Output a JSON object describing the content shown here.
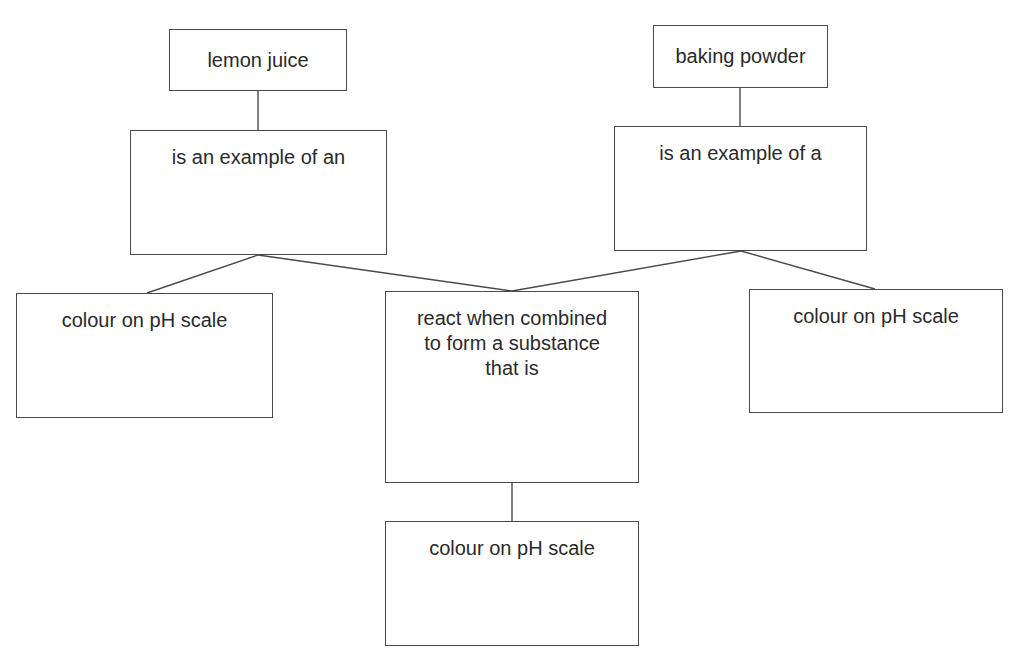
{
  "diagram": {
    "type": "concept-map",
    "nodes": [
      {
        "id": "lemon-juice",
        "label": "lemon juice"
      },
      {
        "id": "acid-example",
        "label": "is an example of an"
      },
      {
        "id": "baking-powder",
        "label": "baking powder"
      },
      {
        "id": "base-example",
        "label": "is an example of a"
      },
      {
        "id": "ph-colour-left",
        "label": "colour on pH scale"
      },
      {
        "id": "reaction",
        "label": "react when combined to form a substance that is"
      },
      {
        "id": "ph-colour-right",
        "label": "colour on pH scale"
      },
      {
        "id": "ph-colour-bottom",
        "label": "colour on pH scale"
      }
    ],
    "edges": [
      {
        "from": "lemon-juice",
        "to": "acid-example"
      },
      {
        "from": "baking-powder",
        "to": "base-example"
      },
      {
        "from": "acid-example",
        "to": "ph-colour-left"
      },
      {
        "from": "acid-example",
        "to": "reaction"
      },
      {
        "from": "base-example",
        "to": "reaction"
      },
      {
        "from": "base-example",
        "to": "ph-colour-right"
      },
      {
        "from": "reaction",
        "to": "ph-colour-bottom"
      }
    ]
  },
  "colors": {
    "line": "#4a4a4a",
    "text": "#2a2a2a",
    "background": "#ffffff"
  }
}
